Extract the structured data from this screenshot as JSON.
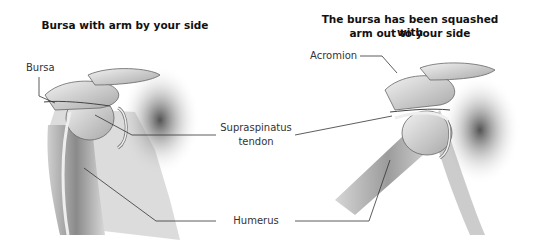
{
  "panels": [
    {
      "title": "Bursa with arm by your side",
      "labels": {
        "bursa": "Bursa"
      }
    },
    {
      "title_line1": "The bursa has been squashed with",
      "title_line2": "arm out to your side",
      "labels": {
        "acromion": "Acromion"
      }
    }
  ],
  "shared_labels": {
    "supraspinatus_line1": "Supraspinatus",
    "supraspinatus_line2": "tendon",
    "humerus": "Humerus"
  },
  "colors": {
    "line": "#333333",
    "bone_light": "#e8e8e8",
    "bone_mid": "#b5b5b5",
    "bone_dark": "#555555"
  }
}
